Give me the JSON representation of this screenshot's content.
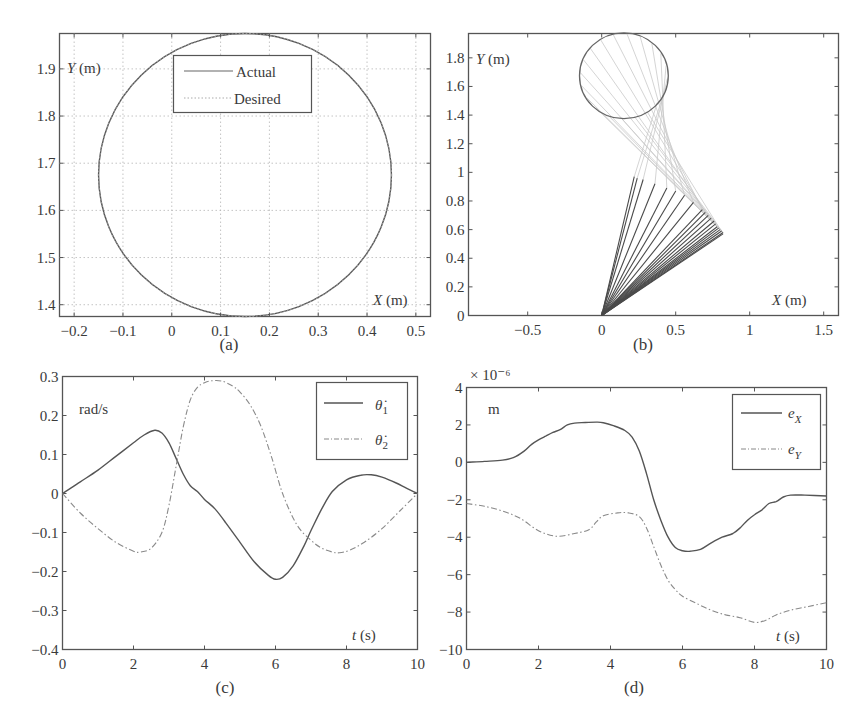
{
  "figure": {
    "panels": [
      "(a)",
      "(b)",
      "(c)",
      "(d)"
    ]
  },
  "chart_data": [
    {
      "id": "a",
      "type": "line",
      "caption": "(a)",
      "title": "",
      "xlabel": "X (m)",
      "ylabel": "Y (m)",
      "xlim": [
        -0.23,
        0.53
      ],
      "ylim": [
        1.375,
        1.975
      ],
      "xticks": [
        -0.2,
        -0.1,
        0,
        0.1,
        0.2,
        0.3,
        0.4,
        0.5
      ],
      "xtick_labels": [
        "−0.2",
        "−0.1",
        "0",
        "0.1",
        "0.2",
        "0.3",
        "0.4",
        "0.5"
      ],
      "yticks": [
        1.4,
        1.5,
        1.6,
        1.7,
        1.8,
        1.9
      ],
      "ytick_labels": [
        "1.4",
        "1.5",
        "1.6",
        "1.7",
        "1.8",
        "1.9"
      ],
      "grid": true,
      "legend": {
        "position": "upper-center",
        "entries": [
          "Actual",
          "Desired"
        ]
      },
      "series": [
        {
          "name": "Actual",
          "style": "solid",
          "shape": "circle",
          "center": [
            0.15,
            1.675
          ],
          "radius": 0.3
        },
        {
          "name": "Desired",
          "style": "dotted",
          "shape": "circle",
          "center": [
            0.15,
            1.675
          ],
          "radius": 0.3
        }
      ]
    },
    {
      "id": "b",
      "type": "line",
      "caption": "(b)",
      "title": "",
      "xlabel": "X (m)",
      "ylabel": "Y (m)",
      "xlim": [
        -0.9,
        1.6
      ],
      "ylim": [
        0,
        1.97
      ],
      "xticks": [
        -0.5,
        0,
        0.5,
        1,
        1.5
      ],
      "xtick_labels": [
        "−0.5",
        "0",
        "0.5",
        "1",
        "1.5"
      ],
      "yticks": [
        0,
        0.2,
        0.4,
        0.6,
        0.8,
        1,
        1.2,
        1.4,
        1.6,
        1.8
      ],
      "ytick_labels": [
        "0",
        "0.2",
        "0.4",
        "0.6",
        "0.8",
        "1",
        "1.2",
        "1.4",
        "1.6",
        "1.8"
      ],
      "grid": false,
      "description": "Two-link arm stick diagram: base at origin, elbow positions sweep from (0.22,0.97) to (0.82,0.57); end-effector traces circle centered (0.15,1.675) r=0.3",
      "series": [
        {
          "name": "end-effector path",
          "shape": "circle",
          "center": [
            0.15,
            1.675
          ],
          "radius": 0.3
        },
        {
          "name": "link 1 (dark)",
          "from": [
            0,
            0
          ],
          "elbows": [
            [
              0.22,
              0.97
            ],
            [
              0.24,
              0.96
            ],
            [
              0.28,
              0.95
            ],
            [
              0.36,
              0.92
            ],
            [
              0.44,
              0.89
            ],
            [
              0.5,
              0.87
            ],
            [
              0.56,
              0.84
            ],
            [
              0.62,
              0.79
            ],
            [
              0.68,
              0.74
            ],
            [
              0.7,
              0.72
            ],
            [
              0.72,
              0.7
            ],
            [
              0.74,
              0.68
            ],
            [
              0.76,
              0.66
            ],
            [
              0.77,
              0.64
            ],
            [
              0.78,
              0.62
            ],
            [
              0.79,
              0.61
            ],
            [
              0.8,
              0.6
            ],
            [
              0.81,
              0.59
            ],
            [
              0.82,
              0.58
            ],
            [
              0.82,
              0.57
            ]
          ]
        },
        {
          "name": "link 2 (light)"
        }
      ]
    },
    {
      "id": "c",
      "type": "line",
      "caption": "(c)",
      "title": "",
      "xlabel": "t (s)",
      "ylabel": "rad/s",
      "xlim": [
        0,
        10
      ],
      "ylim": [
        -0.4,
        0.3
      ],
      "xticks": [
        0,
        2,
        4,
        6,
        8,
        10
      ],
      "xtick_labels": [
        "0",
        "2",
        "4",
        "6",
        "8",
        "10"
      ],
      "yticks": [
        -0.4,
        -0.3,
        -0.2,
        -0.1,
        0,
        0.1,
        0.2,
        0.3
      ],
      "ytick_labels": [
        "−0.4",
        "−0.3",
        "−0.2",
        "−0.1",
        "0",
        "0.1",
        "0.2",
        "0.3"
      ],
      "grid": false,
      "legend": {
        "position": "upper-right",
        "entries": [
          "θ̇₁",
          "θ̇₂"
        ]
      },
      "series": [
        {
          "name": "theta1_dot",
          "style": "solid",
          "x": [
            0,
            0.5,
            1,
            1.5,
            2,
            2.3,
            2.6,
            2.8,
            3.0,
            3.2,
            3.4,
            3.6,
            3.8,
            4.0,
            4.3,
            4.6,
            5.0,
            5.4,
            5.8,
            6.0,
            6.2,
            6.5,
            6.8,
            7.0,
            7.3,
            7.6,
            8.0,
            8.4,
            8.7,
            9.0,
            9.4,
            9.7,
            10
          ],
          "y": [
            0,
            0.03,
            0.06,
            0.095,
            0.13,
            0.15,
            0.162,
            0.155,
            0.13,
            0.09,
            0.05,
            0.02,
            0.005,
            -0.015,
            -0.04,
            -0.075,
            -0.125,
            -0.175,
            -0.21,
            -0.22,
            -0.215,
            -0.185,
            -0.135,
            -0.095,
            -0.04,
            0.005,
            0.035,
            0.047,
            0.048,
            0.042,
            0.027,
            0.013,
            0
          ]
        },
        {
          "name": "theta2_dot",
          "style": "dashdot",
          "x": [
            0,
            0.5,
            1,
            1.5,
            2,
            2.2,
            2.5,
            2.8,
            3.0,
            3.2,
            3.4,
            3.6,
            3.8,
            4.0,
            4.2,
            4.5,
            4.8,
            5.0,
            5.3,
            5.6,
            5.9,
            6.2,
            6.6,
            7.0,
            7.3,
            7.6,
            7.8,
            8.1,
            8.5,
            9.0,
            9.5,
            10
          ],
          "y": [
            0,
            -0.05,
            -0.09,
            -0.125,
            -0.148,
            -0.15,
            -0.14,
            -0.1,
            -0.03,
            0.07,
            0.17,
            0.24,
            0.272,
            0.284,
            0.289,
            0.288,
            0.275,
            0.26,
            0.225,
            0.17,
            0.09,
            0.0,
            -0.08,
            -0.12,
            -0.14,
            -0.15,
            -0.152,
            -0.145,
            -0.125,
            -0.09,
            -0.045,
            0
          ]
        }
      ]
    },
    {
      "id": "d",
      "type": "line",
      "caption": "(d)",
      "title": "",
      "xlabel": "t (s)",
      "ylabel": "m",
      "y_multiplier": "× 10⁻⁶",
      "xlim": [
        0,
        10
      ],
      "ylim": [
        -10,
        4
      ],
      "xticks": [
        0,
        2,
        4,
        6,
        8,
        10
      ],
      "xtick_labels": [
        "0",
        "2",
        "4",
        "6",
        "8",
        "10"
      ],
      "yticks": [
        -10,
        -8,
        -6,
        -4,
        -2,
        0,
        2,
        4
      ],
      "ytick_labels": [
        "−10",
        "−8",
        "−6",
        "−4",
        "−2",
        "0",
        "2",
        "4"
      ],
      "grid": false,
      "legend": {
        "position": "upper-right",
        "entries": [
          "e_X",
          "e_Y"
        ]
      },
      "series": [
        {
          "name": "e_X",
          "style": "solid",
          "x": [
            0,
            0.5,
            1.0,
            1.3,
            1.6,
            1.8,
            2.0,
            2.2,
            2.4,
            2.6,
            2.8,
            3.0,
            3.3,
            3.6,
            3.8,
            4.1,
            4.4,
            4.6,
            4.8,
            5.0,
            5.2,
            5.4,
            5.6,
            5.8,
            6.0,
            6.2,
            6.5,
            6.8,
            7.1,
            7.4,
            7.6,
            7.8,
            8.0,
            8.2,
            8.4,
            8.6,
            8.8,
            9.0,
            9.4,
            10
          ],
          "y": [
            0,
            0.05,
            0.12,
            0.25,
            0.6,
            0.95,
            1.2,
            1.4,
            1.6,
            1.75,
            2.0,
            2.1,
            2.13,
            2.15,
            2.12,
            1.95,
            1.7,
            1.35,
            0.6,
            -0.6,
            -2.0,
            -3.1,
            -4.0,
            -4.55,
            -4.72,
            -4.75,
            -4.65,
            -4.3,
            -4.0,
            -3.8,
            -3.5,
            -3.1,
            -2.8,
            -2.55,
            -2.2,
            -2.1,
            -1.85,
            -1.75,
            -1.75,
            -1.8
          ]
        },
        {
          "name": "e_Y",
          "style": "dashdot",
          "x": [
            0,
            0.5,
            1.0,
            1.5,
            2.0,
            2.5,
            3.0,
            3.4,
            3.6,
            3.8,
            4.2,
            4.5,
            4.8,
            5.0,
            5.2,
            5.4,
            5.6,
            5.8,
            6.0,
            6.4,
            6.8,
            7.2,
            7.6,
            8.0,
            8.3,
            8.6,
            9.0,
            9.5,
            10
          ],
          "y": [
            -2.2,
            -2.35,
            -2.6,
            -3.0,
            -3.65,
            -3.95,
            -3.8,
            -3.6,
            -3.2,
            -2.85,
            -2.7,
            -2.7,
            -2.9,
            -3.5,
            -4.5,
            -5.5,
            -6.3,
            -6.8,
            -7.15,
            -7.55,
            -7.9,
            -8.15,
            -8.3,
            -8.55,
            -8.45,
            -8.15,
            -7.9,
            -7.7,
            -7.5
          ]
        }
      ]
    }
  ]
}
